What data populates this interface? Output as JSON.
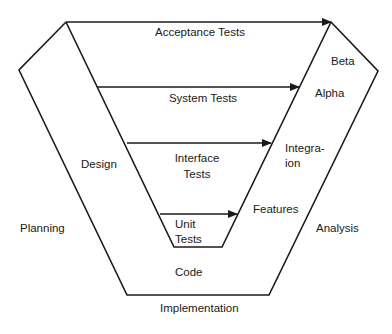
{
  "diagram": {
    "type": "V-model software development / testing lifecycle",
    "stroke_color": "#1a1a1a",
    "background": "#ffffff",
    "tests": {
      "acceptance": "Acceptance Tests",
      "system": "System Tests",
      "interface_line1": "Interface",
      "interface_line2": "Tests",
      "unit_line1": "Unit",
      "unit_line2": "Tests"
    },
    "left_side": {
      "planning": "Planning",
      "design": "Design"
    },
    "bottom": {
      "code": "Code",
      "implementation": "Implementation"
    },
    "right_side": {
      "beta": "Beta",
      "alpha": "Alpha",
      "integration_line1": "Integra-",
      "integration_line2": "ion",
      "features": "Features",
      "analysis": "Analysis"
    }
  }
}
